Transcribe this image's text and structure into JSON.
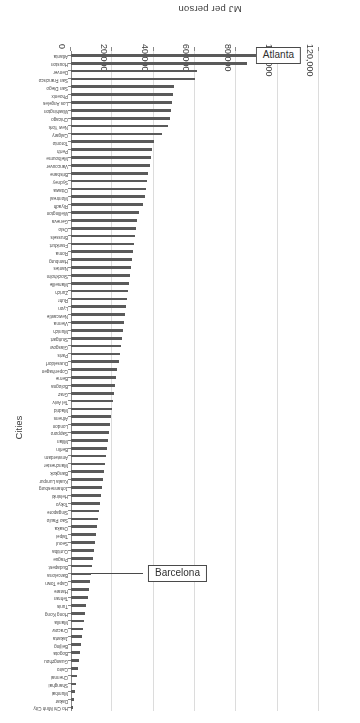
{
  "chart_data": {
    "type": "bar",
    "orientation": "horizontal",
    "title": "",
    "xlabel": "Cities",
    "ylabel": "MJ per person",
    "ylim": [
      0,
      120000
    ],
    "yticks": [
      0,
      20000,
      40000,
      60000,
      80000,
      100000,
      120000
    ],
    "ytick_labels": [
      "0",
      "20,000",
      "40,000",
      "60,000",
      "80,000",
      "100,000",
      "120,000"
    ],
    "grid": true,
    "legend": null,
    "bar_color": "#5a5a5a",
    "annotations": [
      {
        "label": "Atlanta",
        "target_category": "Atlanta"
      },
      {
        "label": "Barcelona",
        "target_category": "Barcelona"
      }
    ],
    "categories": [
      "Atlanta",
      "Houston",
      "Denver",
      "San Francisco",
      "San Diego",
      "Phoenix",
      "Los Angeles",
      "Washington",
      "Chicago",
      "New York",
      "Calgary",
      "Toronto",
      "Perth",
      "Melbourne",
      "Vancouver",
      "Brisbane",
      "Sydney",
      "Ottawa",
      "Montreal",
      "Riyadh",
      "Wellington",
      "Geneva",
      "Oslo",
      "Brussels",
      "Frankfurt",
      "Roma",
      "Hamburg",
      "Nantes",
      "Stockholm",
      "Marseille",
      "Zurich",
      "Ruhr",
      "Lyon",
      "Newcastle",
      "Vienna",
      "Munich",
      "Stuttgart",
      "Glasgow",
      "Paris",
      "Dusseldorf",
      "Copenhagen",
      "Berne",
      "Bologna",
      "Graz",
      "Tel Aviv",
      "Madrid",
      "Athens",
      "London",
      "Sapporo",
      "Milan",
      "Berlin",
      "Amsterdam",
      "Manchester",
      "Bangkok",
      "Kuala Lumpur",
      "Johannesburg",
      "Helsinki",
      "Tokyo",
      "Singapore",
      "Sao Paulo",
      "Osaka",
      "Taipei",
      "Seoul",
      "Curitiba",
      "Prague",
      "Budapest",
      "Barcelona",
      "Cape Town",
      "Harare",
      "Tehran",
      "Tunis",
      "Hong Kong",
      "Manila",
      "Cracow",
      "Jakarta",
      "Beijing",
      "Bogota",
      "Guangzhou",
      "Cairo",
      "Chennai",
      "Shanghai",
      "Mumbai",
      "Dakar",
      "Ho Chi Minh City"
    ],
    "values": [
      103000,
      85000,
      61000,
      60000,
      50000,
      49500,
      49000,
      48500,
      48000,
      47000,
      44000,
      40000,
      39000,
      38500,
      38000,
      37500,
      37000,
      36500,
      36000,
      35000,
      33000,
      32000,
      31500,
      31000,
      30500,
      30000,
      29500,
      29000,
      28500,
      28000,
      27500,
      27000,
      26500,
      26000,
      25500,
      25000,
      24500,
      24000,
      23500,
      23000,
      22500,
      22000,
      21500,
      21000,
      20500,
      20000,
      19500,
      19000,
      18500,
      18000,
      17500,
      17000,
      16500,
      16000,
      15500,
      15000,
      14500,
      14000,
      13500,
      13000,
      12500,
      12000,
      11500,
      11000,
      10500,
      10000,
      9500,
      9000,
      8500,
      8000,
      7500,
      7000,
      6500,
      6000,
      5500,
      5000,
      4500,
      4000,
      3500,
      3000,
      2500,
      2000,
      1500,
      1000
    ]
  }
}
